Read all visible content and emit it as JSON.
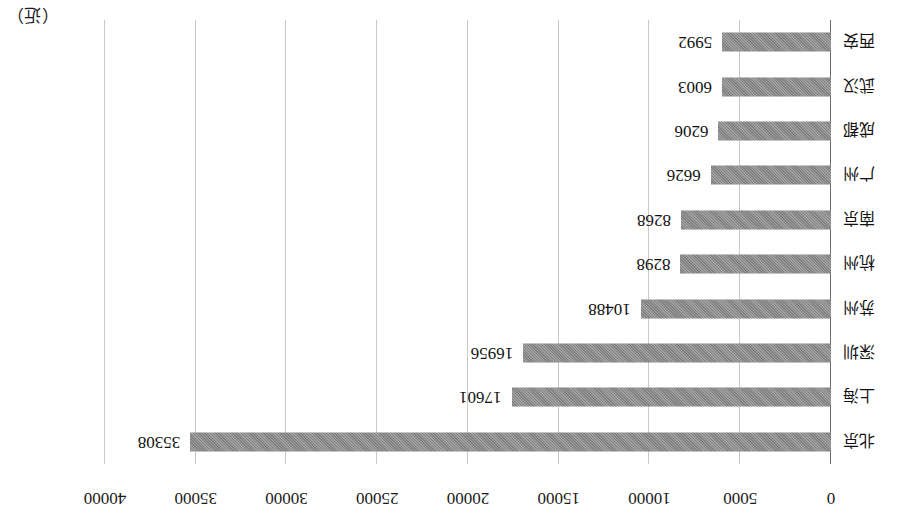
{
  "unit_label": "（近）",
  "chart_data": {
    "type": "bar",
    "orientation": "horizontal",
    "title": "",
    "subtitle": "",
    "xlabel": "",
    "ylabel": "",
    "unit_note": "（近）",
    "grid": true,
    "legend": false,
    "rotated_180": true,
    "xlim": [
      0,
      40000
    ],
    "xticks": [
      0,
      5000,
      10000,
      15000,
      20000,
      25000,
      30000,
      35000,
      40000
    ],
    "xtick_labels": [
      "0",
      "5000",
      "10000",
      "15000",
      "20000",
      "25000",
      "30000",
      "35000",
      "40000"
    ],
    "categories": [
      "北京",
      "上海",
      "深圳",
      "苏州",
      "杭州",
      "南京",
      "广州",
      "成都",
      "武汉",
      "西安"
    ],
    "values": [
      35308,
      17601,
      16956,
      10488,
      8298,
      8268,
      6626,
      6206,
      6003,
      5992
    ],
    "value_labels": [
      "35308",
      "17601",
      "16956",
      "10488",
      "8298",
      "8268",
      "6626",
      "6206",
      "6003",
      "5992"
    ],
    "bar_color": "#8a8a8a",
    "gridline_color": "#c9c9c9",
    "axis_color": "#6b6b6b"
  }
}
